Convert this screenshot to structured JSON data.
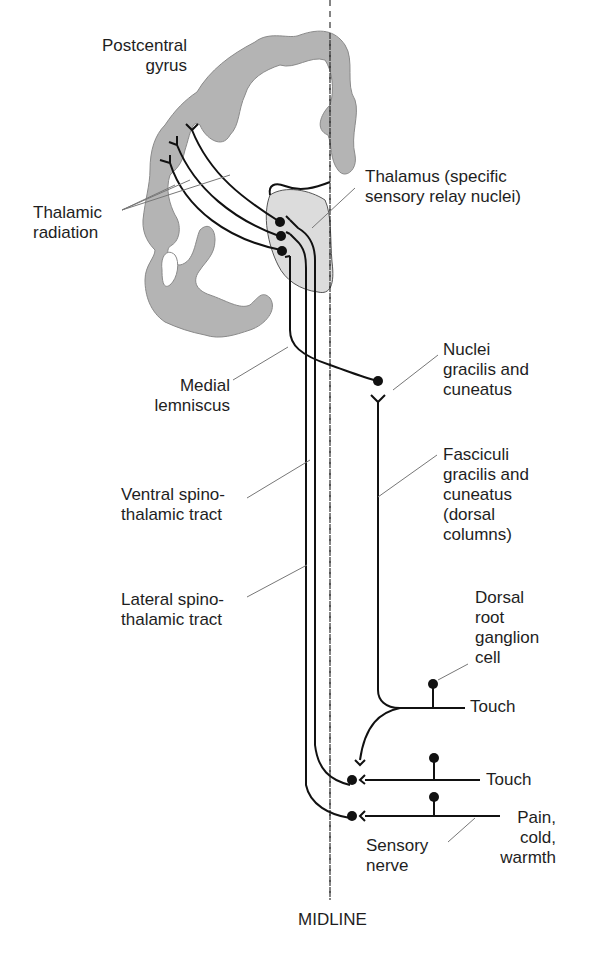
{
  "diagram": {
    "labels": {
      "postcentral_gyrus": "Postcentral\ngyrus",
      "thalamic_radiation": "Thalamic\nradiation",
      "thalamus": "Thalamus (specific\nsensory relay nuclei)",
      "medial_lemniscus": "Medial\nlemniscus",
      "nuclei_gracilis": "Nuclei\ngracilis and\ncuneatus",
      "fasciculi_gracilis": "Fasciculi\ngracilis and\ncuneatus\n(dorsal\ncolumns)",
      "ventral_spinothalamic": "Ventral spino-\nthalamic tract",
      "lateral_spinothalamic": "Lateral spino-\nthalamic tract",
      "dorsal_root_ganglion": "Dorsal\nroot\nganglion\ncell",
      "touch_1": "Touch",
      "touch_2": "Touch",
      "pain": "Pain,\ncold,\nwarmth",
      "sensory_nerve": "Sensory\nnerve",
      "midline": "MIDLINE"
    },
    "colors": {
      "cortex_fill": "#b4b4b4",
      "thalamus_fill": "#dcdcdc",
      "line": "#111111",
      "leader": "#777777"
    }
  }
}
